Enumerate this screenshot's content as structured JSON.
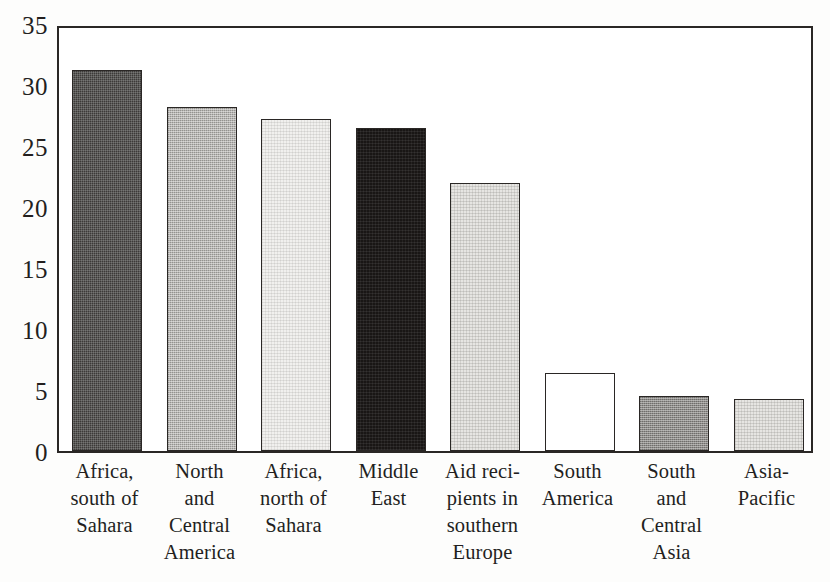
{
  "chart_data": {
    "type": "bar",
    "title": "",
    "subtitle": "",
    "xlabel": "",
    "ylabel": "",
    "ylim": [
      0,
      35
    ],
    "yticks": [
      0,
      5,
      10,
      15,
      20,
      25,
      30,
      35
    ],
    "ytick_labels": [
      "0",
      "5",
      "10",
      "15",
      "20",
      "25",
      "30",
      "35"
    ],
    "grid": false,
    "legend": "none",
    "categories": [
      "Africa, south of Sahara",
      "North and Central America",
      "Africa, north of Sahara",
      "Middle East",
      "Aid recipients in southern Europe",
      "South America",
      "South and Central Asia",
      "Asia-Pacific"
    ],
    "category_lines": [
      [
        "Africa,",
        "south of",
        "Sahara"
      ],
      [
        "North",
        "and",
        "Central",
        "America"
      ],
      [
        "Africa,",
        "north of",
        "Sahara"
      ],
      [
        "Middle",
        "East"
      ],
      [
        "Aid reci-",
        "pients in",
        "southern",
        "Europe"
      ],
      [
        "South",
        "America"
      ],
      [
        "South",
        "and",
        "Central",
        "Asia"
      ],
      [
        "Asia-",
        "Pacific"
      ]
    ],
    "values": [
      31.2,
      28.2,
      27.2,
      26.5,
      22.0,
      6.4,
      4.5,
      4.3
    ],
    "bar_fills": [
      "dark",
      "mid",
      "verylight",
      "black",
      "light",
      "white",
      "graydark",
      "light"
    ],
    "colors": {
      "dark": "#3c3a38",
      "black": "#191615",
      "mid": "#b6b4b1",
      "light": "#e6e5e2",
      "verylight": "#f1f0ee",
      "white": "#ffffff",
      "graydark": "#8e8c89",
      "axis": "#2a2725",
      "text": "#231f1e",
      "background": "#ffffff"
    }
  }
}
